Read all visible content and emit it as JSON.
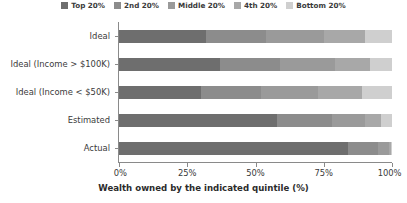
{
  "legend": {
    "position": "top-center",
    "items": [
      {
        "label": "Top 20%",
        "color": "#6e6e6e"
      },
      {
        "label": "2nd 20%",
        "color": "#8c8c8c"
      },
      {
        "label": "Middle 20%",
        "color": "#9a9a9a"
      },
      {
        "label": "4th 20%",
        "color": "#a8a8a8"
      },
      {
        "label": "Bottom 20%",
        "color": "#cfcfcf"
      }
    ]
  },
  "axes": {
    "x": {
      "title": "Wealth owned by the indicated quintile (%)",
      "ticks": [
        {
          "value": 0,
          "label": "0%"
        },
        {
          "value": 25,
          "label": "25%"
        },
        {
          "value": 50,
          "label": "50%"
        },
        {
          "value": 75,
          "label": "75%"
        },
        {
          "value": 100,
          "label": "100%"
        }
      ],
      "min": 0,
      "max": 100
    },
    "y": {
      "title": "",
      "ticks": [
        {
          "label": "Ideal"
        },
        {
          "label": "Ideal (Income > $100K)"
        },
        {
          "label": "Ideal (Income < $50K)"
        },
        {
          "label": "Estimated"
        },
        {
          "label": "Actual"
        }
      ]
    }
  },
  "chart_data": {
    "type": "bar",
    "orientation": "horizontal",
    "stacked": true,
    "title": "",
    "subtitle": "",
    "xlabel": "Wealth owned by the indicated quintile (%)",
    "ylabel": "",
    "xlim": [
      0,
      100
    ],
    "grid": false,
    "legend_position": "top-center",
    "categories": [
      "Ideal",
      "Ideal (Income > $100K)",
      "Ideal (Income < $50K)",
      "Estimated",
      "Actual"
    ],
    "series": [
      {
        "name": "Top 20%",
        "color": "#6e6e6e",
        "values": [
          32,
          37,
          30,
          58,
          84
        ]
      },
      {
        "name": "2nd 20%",
        "color": "#8c8c8c",
        "values": [
          22,
          22,
          22,
          20,
          11
        ]
      },
      {
        "name": "Middle 20%",
        "color": "#9a9a9a",
        "values": [
          21,
          20,
          21,
          12,
          4
        ]
      },
      {
        "name": "4th 20%",
        "color": "#a8a8a8",
        "values": [
          15,
          13,
          16,
          6,
          0.7
        ]
      },
      {
        "name": "Bottom 20%",
        "color": "#cfcfcf",
        "values": [
          10,
          8,
          11,
          4,
          0.3
        ]
      }
    ]
  }
}
